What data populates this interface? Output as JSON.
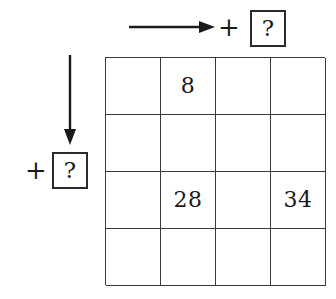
{
  "figure": {
    "type": "math-puzzle-grid",
    "unknown_symbol": "?",
    "operator_symbol": "+",
    "colors": {
      "grid_line": "#3a3a3a",
      "box_border": "#2b2b2b",
      "text": "#1a1a1a",
      "background": "#ffffff",
      "arrow": "#1a1a1a"
    }
  },
  "top_annotation": {
    "arrow_icon": "arrow-right-icon",
    "arrow_direction": "right",
    "operator": "+",
    "value": "?"
  },
  "left_annotation": {
    "arrow_icon": "arrow-down-icon",
    "arrow_direction": "down",
    "operator": "+",
    "value": "?"
  },
  "grid": {
    "rows": 4,
    "columns": 4,
    "cells": [
      [
        "",
        "8",
        "",
        ""
      ],
      [
        "",
        "",
        "",
        ""
      ],
      [
        "",
        "28",
        "",
        "34"
      ],
      [
        "",
        "",
        "",
        ""
      ]
    ],
    "filled_values": [
      {
        "row": 1,
        "column": 2,
        "value": "8"
      },
      {
        "row": 3,
        "column": 2,
        "value": "28"
      },
      {
        "row": 3,
        "column": 4,
        "value": "34"
      }
    ]
  }
}
